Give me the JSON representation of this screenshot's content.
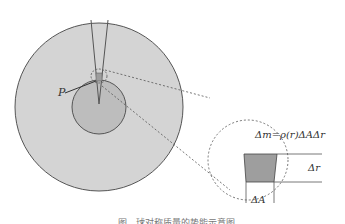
{
  "figure": {
    "labels": {
      "point": "P",
      "mass_formula": "Δm=ρ(r)ΔAΔr",
      "delta_r": "Δr",
      "delta_A": "ΔA"
    },
    "caption": "图 . 球对称质量的势能示意图",
    "colors": {
      "outer_fill": "#d4d4d4",
      "inner_fill": "#bdbdbd",
      "element_fill": "#9e9e9e",
      "stroke": "#555555"
    }
  }
}
